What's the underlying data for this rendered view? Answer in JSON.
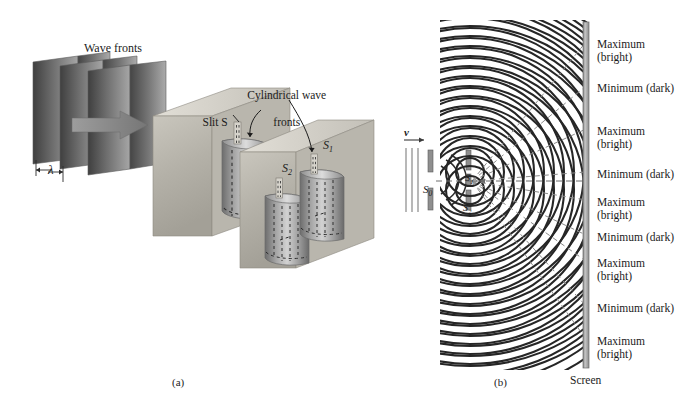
{
  "figure": {
    "title_a": "Wave fronts",
    "label_wavelength": "λ",
    "label_slit_s": "Slit S",
    "label_cylindrical_1": "Cylindrical wave",
    "label_cylindrical_2": "fronts",
    "label_s1": "S",
    "label_s1_sub": "1",
    "label_s2": "S",
    "label_s2_sub": "2",
    "caption_a": "(a)",
    "caption_b": "(b)"
  },
  "panel_b": {
    "label_velocity": "v",
    "label_s0": "S",
    "label_s0_sub": "0",
    "label_s1": "S",
    "label_s1_sub": "1",
    "label_s2": "S",
    "label_s2_sub": "2",
    "screen_label": "Screen",
    "fringes": [
      {
        "y": 38,
        "line1": "Maximum",
        "line2": "(bright)"
      },
      {
        "y": 82,
        "line1": "Minimum (dark)",
        "line2": ""
      },
      {
        "y": 125,
        "line1": "Maximum",
        "line2": "(bright)"
      },
      {
        "y": 168,
        "line1": "Minimum (dark)",
        "line2": ""
      },
      {
        "y": 196,
        "line1": "Maximum",
        "line2": "(bright)"
      },
      {
        "y": 231,
        "line1": "Minimum (dark)",
        "line2": ""
      },
      {
        "y": 257,
        "line1": "Maximum",
        "line2": "(bright)"
      },
      {
        "y": 302,
        "line1": "Minimum (dark)",
        "line2": ""
      },
      {
        "y": 335,
        "line1": "Maximum",
        "line2": "(bright)"
      }
    ]
  },
  "colors": {
    "ink": "#1c1c1c",
    "panel_face": "#b8b5ad",
    "panel_edge": "#d6d3cb",
    "panel_side": "#8f8c85",
    "wave_front_dark": "#4c4c4c",
    "wave_front_light": "#9a9a9a",
    "cylinder_dark": "#6e6e6e",
    "cylinder_light": "#c9c9c9",
    "screen_gray": "#a9a9a9",
    "wave_arc": "#2b2b2b",
    "dashed_ray": "#8a8a8a"
  }
}
